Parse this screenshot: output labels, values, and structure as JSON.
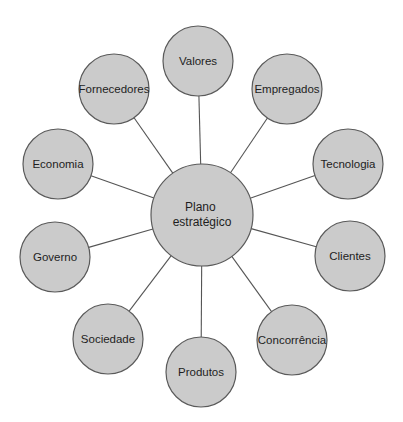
{
  "diagram": {
    "type": "hub-and-spoke",
    "colors": {
      "node_fill": "#cbcbcb",
      "node_stroke": "#5a5a5a",
      "connector": "#555555",
      "text": "#1e1e1e",
      "background": "#ffffff"
    },
    "hub": {
      "label_line1": "Plano",
      "label_line2": "estratégico",
      "cx": 202,
      "cy": 215,
      "r": 51
    },
    "nodes": [
      {
        "label": "Valores",
        "cx": 198,
        "cy": 61,
        "r": 35
      },
      {
        "label": "Empregados",
        "cx": 287,
        "cy": 89,
        "r": 35
      },
      {
        "label": "Tecnologia",
        "cx": 348,
        "cy": 164,
        "r": 35
      },
      {
        "label": "Clientes",
        "cx": 350,
        "cy": 256,
        "r": 35
      },
      {
        "label": "Concorrência",
        "cx": 292,
        "cy": 340,
        "r": 35
      },
      {
        "label": "Produtos",
        "cx": 201,
        "cy": 372,
        "r": 35
      },
      {
        "label": "Sociedade",
        "cx": 108,
        "cy": 339,
        "r": 35
      },
      {
        "label": "Governo",
        "cx": 55,
        "cy": 257,
        "r": 35
      },
      {
        "label": "Economia",
        "cx": 58,
        "cy": 164,
        "r": 35
      },
      {
        "label": "Fornecedores",
        "cx": 114,
        "cy": 89,
        "r": 35
      }
    ]
  }
}
